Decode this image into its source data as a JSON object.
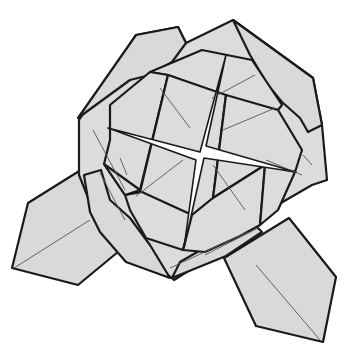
{
  "figure": {
    "type": "origami-diagram",
    "colors": {
      "paper": "#d9d9d9",
      "outline": "#1a1a1a",
      "crease": "#555555",
      "background": "#ffffff"
    },
    "outer_body": "136,35 178,27 186,43 233,20 313,78 322,125 327,180 312,185 248,222 232,230 220,251 174,280 128,240 97,220 79,175 79,120",
    "top_left_flap": "78,118 136,35 178,27 186,43 172,62 150,75 130,80",
    "top_right_flap": "233,20 313,78 322,125 308,132 300,118 282,102 268,85 250,55",
    "left_diamond": "12,268 28,203 84,168 97,222 130,242 78,285",
    "right_diamond": "224,258 289,218 336,277 323,342 256,326",
    "left_mid_flap": "84,175 101,170 110,200 130,218 150,245 170,278 126,262 100,232 90,212",
    "bottom_mid_flap": "172,278 226,256 262,232 250,220 218,240 180,262",
    "inner_faces": [
      "150,72 202,50 252,60 282,105 278,110 232,98 168,75",
      "110,105 150,72 168,75 140,190 125,195 104,164 110,140",
      "140,192 168,75 226,95 213,198 192,215",
      "226,95 278,110 302,150 295,172 265,165 213,198",
      "125,195 142,192 192,215 183,250 146,238 130,210",
      "192,215 213,198 265,165 260,225 240,236 205,252 183,250",
      "265,165 295,172 278,210 260,225",
      "104,164 140,190 125,195"
    ],
    "star_opening": "200,152 226,55 206,146 296,172 204,158 184,248 196,160 108,128",
    "creases": [
      [
        93,
        130,
        125,
        190
      ],
      [
        160,
        88,
        190,
        128
      ],
      [
        223,
        130,
        275,
        108
      ],
      [
        136,
        196,
        183,
        160
      ],
      [
        213,
        165,
        245,
        210
      ],
      [
        14,
        268,
        90,
        220
      ],
      [
        255,
        75,
        212,
        98
      ],
      [
        205,
        255,
        258,
        228
      ],
      [
        120,
        158,
        127,
        175
      ],
      [
        256,
        265,
        320,
        340
      ],
      [
        170,
        268,
        248,
        232
      ],
      [
        100,
        173,
        125,
        220
      ],
      [
        266,
        160,
        302,
        175
      ],
      [
        312,
        165,
        303,
        155
      ]
    ]
  }
}
